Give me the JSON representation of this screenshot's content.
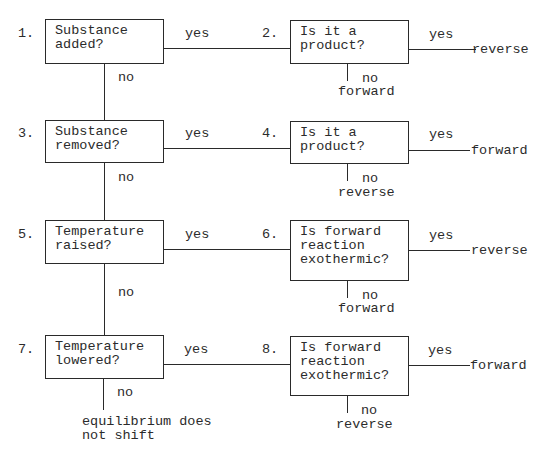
{
  "diagram": {
    "title": "",
    "nodes": [
      {
        "id": 1,
        "number": "1.",
        "question": "Substance\nadded?",
        "yes_label": "yes",
        "no_label": "no"
      },
      {
        "id": 2,
        "number": "2.",
        "question": "Is it a\nproduct?",
        "yes_label": "yes",
        "yes_result": "reverse",
        "no_label": "no",
        "no_result": "forward"
      },
      {
        "id": 3,
        "number": "3.",
        "question": "Substance\nremoved?",
        "yes_label": "yes",
        "no_label": "no"
      },
      {
        "id": 4,
        "number": "4.",
        "question": "Is it a\nproduct?",
        "yes_label": "yes",
        "yes_result": "forward",
        "no_label": "no",
        "no_result": "reverse"
      },
      {
        "id": 5,
        "number": "5.",
        "question": "Temperature\nraised?",
        "yes_label": "yes",
        "no_label": "no"
      },
      {
        "id": 6,
        "number": "6.",
        "question": "Is forward\nreaction\nexothermic?",
        "yes_label": "yes",
        "yes_result": "reverse",
        "no_label": "no",
        "no_result": "forward"
      },
      {
        "id": 7,
        "number": "7.",
        "question": "Temperature\nlowered?",
        "yes_label": "yes",
        "no_label": "no",
        "no_result": "equilibrium does\nnot shift"
      },
      {
        "id": 8,
        "number": "8.",
        "question": "Is forward\nreaction\nexothermic?",
        "yes_label": "yes",
        "yes_result": "forward",
        "no_label": "no",
        "no_result": "reverse"
      }
    ],
    "edges": [
      {
        "from": 1,
        "to": 2,
        "label": "yes"
      },
      {
        "from": 1,
        "to": 3,
        "label": "no"
      },
      {
        "from": 3,
        "to": 4,
        "label": "yes"
      },
      {
        "from": 3,
        "to": 5,
        "label": "no"
      },
      {
        "from": 5,
        "to": 6,
        "label": "yes"
      },
      {
        "from": 5,
        "to": 7,
        "label": "no"
      },
      {
        "from": 7,
        "to": 8,
        "label": "yes"
      }
    ]
  }
}
